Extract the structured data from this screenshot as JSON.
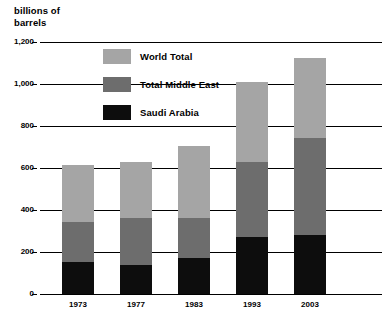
{
  "chart_data": {
    "type": "bar",
    "subtype": "stacked-bar",
    "title": "billions of\nbarrels",
    "xlabel": "",
    "ylabel": "billions of barrels",
    "categories": [
      "1973",
      "1977",
      "1983",
      "1993",
      "2003"
    ],
    "series": [
      {
        "name": "Saudi Arabia",
        "color": "#0d0d0d",
        "values": [
          152,
          138,
          171,
          271,
          281
        ]
      },
      {
        "name": "Total Middle East",
        "color": "#6d6d6d",
        "values": [
          343,
          362,
          362,
          629,
          743
        ]
      },
      {
        "name": "World Total",
        "color": "#a5a5a5",
        "values": [
          614,
          629,
          705,
          1010,
          1124
        ]
      }
    ],
    "stack_note": "Series values are cumulative totals: Saudi Arabia is a subset of Total Middle East, which is a subset of World Total.",
    "ylim": [
      0,
      1200
    ],
    "yticks": [
      "0",
      "200",
      "400",
      "600",
      "800",
      "1,000",
      "1,200"
    ],
    "ytick_values": [
      0,
      200,
      400,
      600,
      800,
      1000,
      1200
    ],
    "grid": true,
    "legend_position": "inside-top-center"
  },
  "legend": {
    "items": [
      {
        "label": "World Total",
        "color": "#a5a5a5"
      },
      {
        "label": "Total Middle East",
        "color": "#6d6d6d"
      },
      {
        "label": "Saudi Arabia",
        "color": "#0d0d0d"
      }
    ]
  }
}
